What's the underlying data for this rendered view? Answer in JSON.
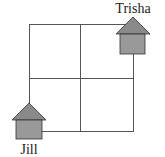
{
  "diagram": {
    "type": "grid-map",
    "grid": {
      "rows": 2,
      "cols": 2,
      "line_color": "#555555"
    },
    "houses": [
      {
        "name": "Trisha",
        "position": "top-right corner",
        "roof_color": "#8a8a8a",
        "body_color": "#999999"
      },
      {
        "name": "Jill",
        "position": "bottom-left corner",
        "roof_color": "#8a8a8a",
        "body_color": "#999999"
      }
    ],
    "labels": {
      "trisha": "Trisha",
      "jill": "Jill"
    }
  }
}
